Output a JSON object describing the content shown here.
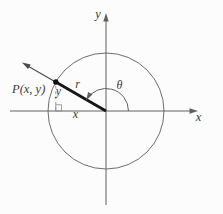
{
  "figure": {
    "background_color": "#fcfcfc",
    "line_color": "#606060",
    "emphasis_color": "#161616",
    "dashed_color": "#8a8a8a",
    "text_color": "#3a3a3a",
    "labels": {
      "point": "P(x, y)",
      "radius": "r",
      "angle": "θ",
      "x_axis": "x",
      "y_axis": "y",
      "x_coordinate": "x",
      "y_coordinate": "y"
    }
  }
}
